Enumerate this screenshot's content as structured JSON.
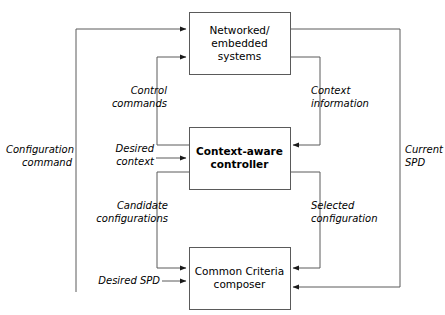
{
  "diagram": {
    "stroke_color": "#5a5a5a",
    "text_color": "#000000",
    "background": "#ffffff",
    "boxes": [
      {
        "id": "networked-embedded-systems",
        "label": "Networked/\nembedded\nsystems",
        "bold": false,
        "x": 189,
        "y": 12,
        "w": 101,
        "h": 62
      },
      {
        "id": "context-aware-controller",
        "label": "Context-aware\ncontroller",
        "bold": true,
        "x": 189,
        "y": 127,
        "w": 101,
        "h": 62
      },
      {
        "id": "common-criteria-composer",
        "label": "Common Criteria\ncomposer",
        "bold": false,
        "x": 189,
        "y": 247,
        "w": 101,
        "h": 62
      }
    ],
    "edge_labels": [
      {
        "id": "configuration-command",
        "text": "Configuration\ncommand",
        "x": 6,
        "y": 143,
        "w": 66,
        "align": "right"
      },
      {
        "id": "current-spd",
        "text": "Current\nSPD",
        "x": 405,
        "y": 143,
        "w": 40,
        "align": "left"
      },
      {
        "id": "control-commands",
        "text": "Control\ncommands",
        "x": 95,
        "y": 84,
        "w": 72,
        "align": "right"
      },
      {
        "id": "context-information",
        "text": "Context\ninformation",
        "x": 311,
        "y": 84,
        "w": 80,
        "align": "left"
      },
      {
        "id": "desired-context",
        "text": "Desired\ncontext",
        "x": 104,
        "y": 142,
        "w": 50,
        "align": "right"
      },
      {
        "id": "candidate-configurations",
        "text": "Candidate\nconfigurations",
        "x": 88,
        "y": 199,
        "w": 80,
        "align": "right"
      },
      {
        "id": "selected-configuration",
        "text": "Selected\nconfiguration",
        "x": 311,
        "y": 199,
        "w": 85,
        "align": "left"
      },
      {
        "id": "desired-spd",
        "text": "Desired SPD",
        "x": 94,
        "y": 267,
        "w": 66,
        "align": "right"
      }
    ],
    "connectors": [
      {
        "id": "configuration-command-path",
        "points": "76,292 76,29 186,29",
        "arrow": "end"
      },
      {
        "id": "current-spd-path",
        "points": "290,29 400,29 400,287 293,287",
        "arrow": "end"
      },
      {
        "id": "control-commands-path",
        "points": "189,145 157,145 157,57 186,57",
        "arrow": "end"
      },
      {
        "id": "context-information-path",
        "points": "290,57 320,57 320,145 293,145",
        "arrow": "end"
      },
      {
        "id": "desired-context-path",
        "points": "156,158 186,158",
        "arrow": "end"
      },
      {
        "id": "candidate-configurations-path",
        "points": "189,172 157,172 157,268 186,268",
        "arrow": "end"
      },
      {
        "id": "selected-configuration-path",
        "points": "290,172 320,172 320,268 293,268",
        "arrow": "end"
      },
      {
        "id": "desired-spd-path",
        "points": "162,281 186,281",
        "arrow": "end"
      }
    ]
  }
}
